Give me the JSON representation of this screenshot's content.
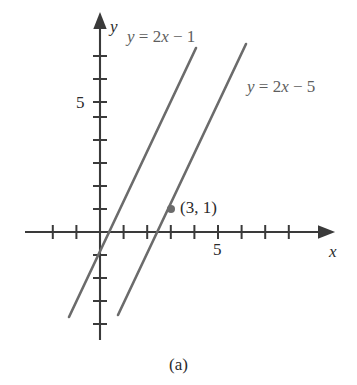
{
  "figure": {
    "caption": "(a)",
    "axis_labels": {
      "x": "x",
      "y": "y"
    },
    "tick_label_x": "5",
    "tick_label_y": "5",
    "point_label": "(3, 1)",
    "line1_label": "y = 2x − 5",
    "line2_label": "y = 2x − 1",
    "colors": {
      "axis": "#3a3a3a",
      "line": "#6b6b6b",
      "point": "#6b6b6b",
      "text": "#2b2b2b",
      "equation_text": "#5e5e5e",
      "background": "#ffffff"
    }
  },
  "chart_data": {
    "type": "line",
    "title": "",
    "xlabel": "x",
    "ylabel": "y",
    "xlim": [
      -3.2,
      9.5
    ],
    "ylim": [
      -4.2,
      9.2
    ],
    "grid": false,
    "legend": "inline-annotations",
    "x_ticks": [
      -3,
      -2,
      -1,
      1,
      2,
      3,
      4,
      5,
      6,
      7,
      8,
      9
    ],
    "y_ticks": [
      -3,
      -2,
      -1,
      1,
      2,
      3,
      4,
      5,
      6,
      7,
      8
    ],
    "x_tick_labels": {
      "5": "5"
    },
    "y_tick_labels": {
      "5": "5"
    },
    "series": [
      {
        "name": "y = 2x − 1",
        "equation": "y = 2x - 1",
        "slope": 2,
        "intercept": -1,
        "x_range": [
          -1.3,
          4.05
        ],
        "points": [
          [
            -1.3,
            -3.6
          ],
          [
            0,
            -1
          ],
          [
            0.5,
            0
          ],
          [
            3,
            5
          ],
          [
            4.05,
            7.1
          ]
        ],
        "label": "y = 2x − 1",
        "label_position": [
          0.55,
          8.6
        ]
      },
      {
        "name": "y = 2x − 5",
        "equation": "y = 2x - 5",
        "slope": 2,
        "intercept": -5,
        "x_range": [
          0.75,
          6.2
        ],
        "points": [
          [
            0.75,
            -3.5
          ],
          [
            2.5,
            0
          ],
          [
            3,
            1
          ],
          [
            6.2,
            7.4
          ]
        ],
        "label": "y = 2x − 5",
        "label_position": [
          6.6,
          6.7
        ]
      }
    ],
    "annotations": [
      {
        "text": "(3, 1)",
        "point": [
          3,
          1
        ],
        "marker": "filled-circle",
        "description": "intersection-style marked point on y = 2x - 5"
      }
    ]
  }
}
